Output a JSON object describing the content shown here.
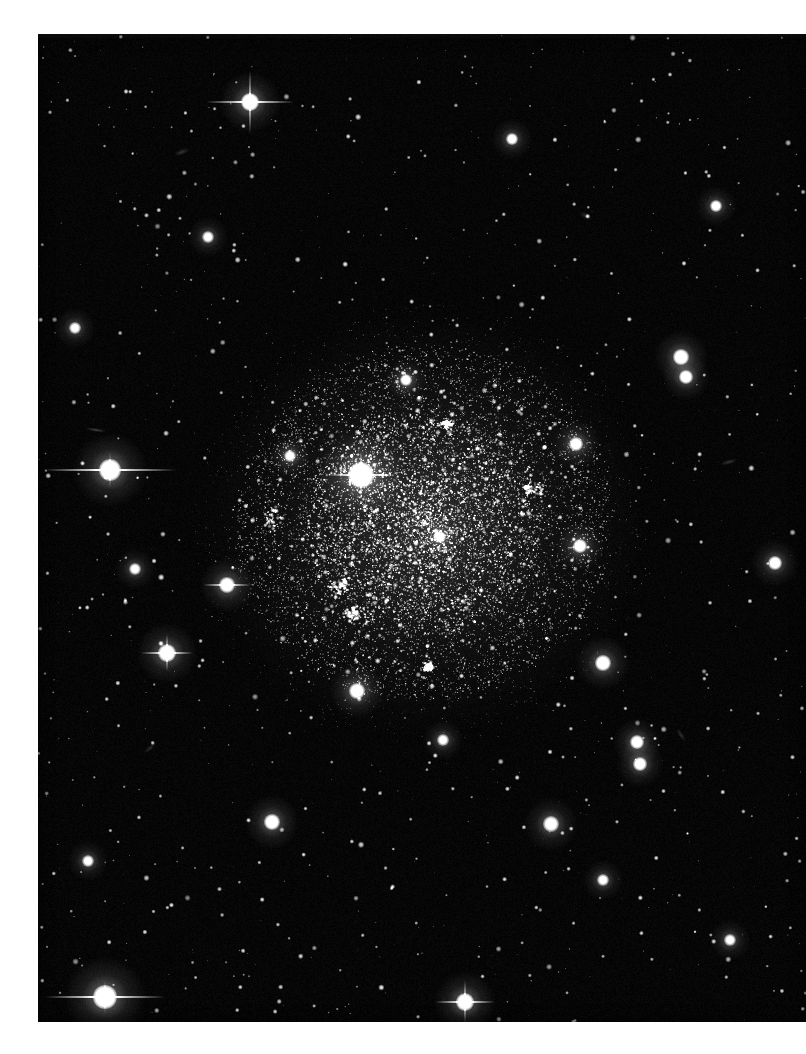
{
  "image": {
    "kind": "astronomical-photographic-plate",
    "subject": "dwarf irregular galaxy resolved into individual stars",
    "orientation": "portrait",
    "media": "monochrome photographic print on white paper",
    "caption": "",
    "alt_text": "Black-and-white deep-sky photograph of a dwarf irregular galaxy resolved into thousands of faint stars, surrounded by a sparse field of foreground stars.",
    "canvas": {
      "width": 806,
      "height": 1054
    }
  },
  "print": {
    "left": 38,
    "top": 34,
    "width": 768,
    "height": 988,
    "paper_color": "#ffffff",
    "sky_color": "#010101",
    "star_color": "#ffffff"
  },
  "scene": {
    "background_sky_level": 1,
    "field_star_count": 1400,
    "galaxy": {
      "name": "dwarf irregular galaxy",
      "center_x": 424,
      "center_y": 523,
      "radius_x": 178,
      "radius_y": 168,
      "rotation_deg": -12,
      "resolved_star_count": 9000,
      "core_star_count": 3200,
      "halo_glow_opacity": 0.16,
      "description": "Irregular, centrally concentrated swarm of faint resolved stars with no spiral structure; brighter knots mark star-forming associations."
    },
    "hii_knots": [
      {
        "name": "knot-southwest",
        "x": 340,
        "y": 585,
        "rx": 34,
        "ry": 26,
        "brightness": 0.55
      },
      {
        "name": "knot-southwest-lower",
        "x": 352,
        "y": 614,
        "rx": 20,
        "ry": 14,
        "brightness": 0.45
      },
      {
        "name": "knot-northeast",
        "x": 533,
        "y": 489,
        "rx": 30,
        "ry": 20,
        "brightness": 0.42
      },
      {
        "name": "knot-west-arc",
        "x": 272,
        "y": 520,
        "rx": 22,
        "ry": 30,
        "brightness": 0.3
      },
      {
        "name": "knot-south",
        "x": 428,
        "y": 667,
        "rx": 14,
        "ry": 11,
        "brightness": 0.38
      },
      {
        "name": "knot-north",
        "x": 447,
        "y": 424,
        "rx": 16,
        "ry": 12,
        "brightness": 0.3
      }
    ],
    "bright_stars": [
      {
        "name": "star-galaxy-core-foreground",
        "x": 361,
        "y": 475,
        "radius": 13,
        "spikes": "cross",
        "spike_len": 34,
        "intensity": 1.0
      },
      {
        "name": "star-west-spiked",
        "x": 110,
        "y": 470,
        "radius": 11,
        "spikes": "horizontal",
        "spike_len": 66,
        "intensity": 1.0
      },
      {
        "name": "star-southwest-bright",
        "x": 105,
        "y": 997,
        "radius": 12,
        "spikes": "horizontal",
        "spike_len": 60,
        "intensity": 1.0
      },
      {
        "name": "star-north-spiked",
        "x": 250,
        "y": 102,
        "radius": 9,
        "spikes": "cross",
        "spike_len": 44,
        "intensity": 0.95
      },
      {
        "name": "star-south-center",
        "x": 465,
        "y": 1002,
        "radius": 9,
        "spikes": "cross",
        "spike_len": 30,
        "intensity": 0.9
      },
      {
        "name": "star-southwest-field",
        "x": 167,
        "y": 653,
        "radius": 9,
        "spikes": "cross",
        "spike_len": 26,
        "intensity": 0.9
      },
      {
        "name": "star-west-low",
        "x": 227,
        "y": 585,
        "radius": 8,
        "spikes": "horizontal",
        "spike_len": 24,
        "intensity": 0.85
      },
      {
        "name": "star-east-mid",
        "x": 681,
        "y": 357,
        "radius": 8,
        "spikes": "none",
        "spike_len": 0,
        "intensity": 0.85
      },
      {
        "name": "star-east-upper",
        "x": 686,
        "y": 377,
        "radius": 7,
        "spikes": "none",
        "spike_len": 0,
        "intensity": 0.8
      },
      {
        "name": "star-southeast-a",
        "x": 603,
        "y": 663,
        "radius": 8,
        "spikes": "none",
        "spike_len": 0,
        "intensity": 0.85
      },
      {
        "name": "star-southeast-b",
        "x": 637,
        "y": 742,
        "radius": 7,
        "spikes": "none",
        "spike_len": 0,
        "intensity": 0.8
      },
      {
        "name": "star-southeast-c",
        "x": 640,
        "y": 764,
        "radius": 7,
        "spikes": "none",
        "spike_len": 0,
        "intensity": 0.8
      },
      {
        "name": "star-south-field-a",
        "x": 272,
        "y": 822,
        "radius": 8,
        "spikes": "none",
        "spike_len": 0,
        "intensity": 0.85
      },
      {
        "name": "star-south-field-b",
        "x": 551,
        "y": 824,
        "radius": 8,
        "spikes": "none",
        "spike_len": 0,
        "intensity": 0.8
      },
      {
        "name": "star-south-field-c",
        "x": 357,
        "y": 691,
        "radius": 8,
        "spikes": "none",
        "spike_len": 0,
        "intensity": 0.85
      },
      {
        "name": "star-east-far",
        "x": 775,
        "y": 563,
        "radius": 7,
        "spikes": "none",
        "spike_len": 0,
        "intensity": 0.8
      },
      {
        "name": "star-galaxy-east",
        "x": 576,
        "y": 444,
        "radius": 7,
        "spikes": "none",
        "spike_len": 0,
        "intensity": 0.8
      },
      {
        "name": "star-galaxy-southeast",
        "x": 580,
        "y": 546,
        "radius": 7,
        "spikes": "none",
        "spike_len": 0,
        "intensity": 0.8
      },
      {
        "name": "star-north-field-a",
        "x": 512,
        "y": 139,
        "radius": 6,
        "spikes": "none",
        "spike_len": 0,
        "intensity": 0.75
      },
      {
        "name": "star-north-field-b",
        "x": 716,
        "y": 206,
        "radius": 6,
        "spikes": "none",
        "spike_len": 0,
        "intensity": 0.75
      },
      {
        "name": "star-northwest-field",
        "x": 208,
        "y": 237,
        "radius": 6,
        "spikes": "none",
        "spike_len": 0,
        "intensity": 0.7
      },
      {
        "name": "star-west-field-a",
        "x": 75,
        "y": 328,
        "radius": 6,
        "spikes": "none",
        "spike_len": 0,
        "intensity": 0.7
      },
      {
        "name": "star-west-field-b",
        "x": 135,
        "y": 569,
        "radius": 6,
        "spikes": "none",
        "spike_len": 0,
        "intensity": 0.7
      },
      {
        "name": "star-mid-field-a",
        "x": 443,
        "y": 740,
        "radius": 6,
        "spikes": "none",
        "spike_len": 0,
        "intensity": 0.7
      },
      {
        "name": "star-mid-field-b",
        "x": 603,
        "y": 880,
        "radius": 6,
        "spikes": "none",
        "spike_len": 0,
        "intensity": 0.7
      },
      {
        "name": "star-se-corner",
        "x": 730,
        "y": 940,
        "radius": 6,
        "spikes": "none",
        "spike_len": 0,
        "intensity": 0.7
      },
      {
        "name": "star-sw-corner",
        "x": 88,
        "y": 861,
        "radius": 6,
        "spikes": "none",
        "spike_len": 0,
        "intensity": 0.7
      },
      {
        "name": "star-north-mid",
        "x": 406,
        "y": 380,
        "radius": 6,
        "spikes": "none",
        "spike_len": 0,
        "intensity": 0.75
      },
      {
        "name": "star-galaxy-nw",
        "x": 290,
        "y": 456,
        "radius": 6,
        "spikes": "none",
        "spike_len": 0,
        "intensity": 0.7
      },
      {
        "name": "star-galaxy-center-small",
        "x": 440,
        "y": 537,
        "radius": 6,
        "spikes": "none",
        "spike_len": 0,
        "intensity": 0.7
      }
    ],
    "faint_galaxies": [
      {
        "name": "edge-on-galaxy-west",
        "x": 96,
        "y": 430,
        "len": 22,
        "thick": 4,
        "angle": 8,
        "brightness": 0.22
      },
      {
        "name": "smudge-northwest",
        "x": 182,
        "y": 152,
        "len": 16,
        "thick": 6,
        "angle": -20,
        "brightness": 0.18
      },
      {
        "name": "smudge-north",
        "x": 586,
        "y": 216,
        "len": 14,
        "thick": 7,
        "angle": 30,
        "brightness": 0.16
      },
      {
        "name": "smudge-east",
        "x": 729,
        "y": 462,
        "len": 18,
        "thick": 5,
        "angle": -15,
        "brightness": 0.18
      },
      {
        "name": "smudge-southeast",
        "x": 681,
        "y": 735,
        "len": 16,
        "thick": 5,
        "angle": 55,
        "brightness": 0.16
      },
      {
        "name": "smudge-southwest",
        "x": 150,
        "y": 748,
        "len": 15,
        "thick": 5,
        "angle": -40,
        "brightness": 0.15
      }
    ]
  }
}
